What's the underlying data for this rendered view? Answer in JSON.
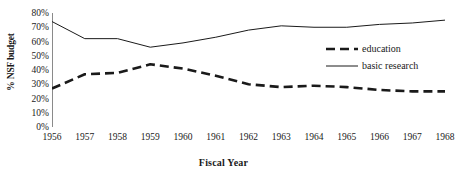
{
  "chart_data": {
    "type": "line",
    "title": "",
    "xlabel": "Fiscal Year",
    "ylabel": "% NSF budget",
    "categories": [
      1956,
      1957,
      1958,
      1959,
      1960,
      1961,
      1962,
      1963,
      1964,
      1965,
      1966,
      1967,
      1968
    ],
    "x_tick_labels": [
      "1956",
      "1957",
      "1958",
      "1959",
      "1960",
      "1961",
      "1962",
      "1963",
      "1964",
      "1965",
      "1966",
      "1967",
      "1968"
    ],
    "y_tick_labels": [
      "80%",
      "70%",
      "60%",
      "50%",
      "40%",
      "30%",
      "20%",
      "10%",
      "0%"
    ],
    "y_tick_values": [
      80,
      70,
      60,
      50,
      40,
      30,
      20,
      10,
      0
    ],
    "ylim": [
      0,
      80
    ],
    "xlim": [
      1956,
      1968
    ],
    "grid": false,
    "legend_position": "right",
    "series": [
      {
        "name": "education",
        "style": "dashed",
        "color": "#1a1a1a",
        "width": 2.6,
        "values": [
          27,
          37,
          38,
          44,
          41,
          36,
          30,
          28,
          29,
          28,
          26,
          25,
          25
        ]
      },
      {
        "name": "basic research",
        "style": "solid",
        "color": "#1a1a1a",
        "width": 1,
        "values": [
          74,
          62,
          62,
          56,
          59,
          63,
          68,
          71,
          70,
          70,
          72,
          73,
          75
        ]
      }
    ]
  },
  "legend": {
    "items": [
      {
        "label": "education"
      },
      {
        "label": "basic research"
      }
    ]
  },
  "colors": {
    "axis": "#8a8a8a",
    "line": "#1a1a1a",
    "background": "#ffffff"
  }
}
